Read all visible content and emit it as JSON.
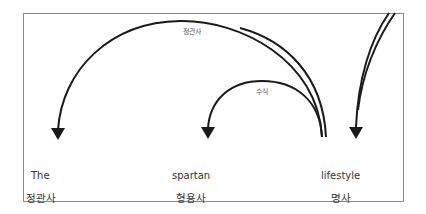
{
  "diagram": {
    "type": "dependency-arcs",
    "colors": {
      "line": "#1a1a1a",
      "frame": "#8a8a8a",
      "text": "#333333",
      "label": "#555555"
    },
    "words": [
      {
        "text": "The",
        "pos": "정관사"
      },
      {
        "text": "spartan",
        "pos": "형용사"
      },
      {
        "text": "lifestyle",
        "pos": "명사"
      }
    ],
    "arcs": [
      {
        "from": "lifestyle",
        "to": "The",
        "label": "정관사"
      },
      {
        "from": "lifestyle",
        "to": "spartan",
        "label": "수식"
      },
      {
        "from": "outside",
        "to": "lifestyle",
        "label": ""
      }
    ]
  }
}
